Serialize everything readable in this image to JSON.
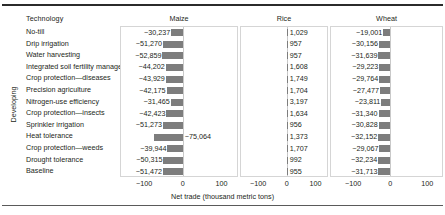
{
  "figure": {
    "group_label": "Developing",
    "technology_header": "Technology",
    "axis_title": "Net trade (thousand metric tons)",
    "tick_labels": [
      "−100",
      "0",
      "100"
    ],
    "tick_values": [
      -100,
      0,
      100
    ],
    "bar_color": "#7d7d7d",
    "panel_border_color": "#d5d5d5",
    "zero_line_color": "#c9c9c9"
  },
  "chart_data": {
    "type": "bar",
    "title": "",
    "subtitle": "",
    "xlabel": "Net trade (thousand metric tons)",
    "ylabel": "Technology",
    "orientation": "horizontal",
    "xlim": [
      -160,
      140
    ],
    "xticks": [
      -100,
      0,
      100
    ],
    "grid": false,
    "legend": "none",
    "units": "thousand metric tons",
    "group": "Developing",
    "panels": [
      "Maize",
      "Rice",
      "Wheat"
    ],
    "categories": [
      "No-till",
      "Drip irrigation",
      "Water harvesting",
      "Integrated soil fertility management",
      "Crop protection—diseases",
      "Precision agriculture",
      "Nitrogen-use efficiency",
      "Crop protection—insects",
      "Sprinkler irrigation",
      "Heat tolerance",
      "Crop protection—weeds",
      "Drought tolerance",
      "Baseline"
    ],
    "series": [
      {
        "name": "Maize",
        "values": [
          -30237,
          -51270,
          -52859,
          -44202,
          -43929,
          -42175,
          -31465,
          -42423,
          -51273,
          -75064,
          -39944,
          -50315,
          -51472
        ],
        "labels": [
          "−30,237",
          "−51,270",
          "−52,859",
          "−44,202",
          "−43,929",
          "−42,175",
          "−31,465",
          "−42,423",
          "−51,273",
          "−75,064",
          "−39,944",
          "−50,315",
          "−51,472"
        ]
      },
      {
        "name": "Rice",
        "values": [
          1029,
          957,
          957,
          1608,
          1749,
          1704,
          3197,
          1634,
          956,
          1373,
          1707,
          992,
          955
        ],
        "labels": [
          "1,029",
          "957",
          "957",
          "1,608",
          "1,749",
          "1,704",
          "3,197",
          "1,634",
          "956",
          "1,373",
          "1,707",
          "992",
          "955"
        ]
      },
      {
        "name": "Wheat",
        "values": [
          -19001,
          -30156,
          -31639,
          -29223,
          -29764,
          -27477,
          -23811,
          -31340,
          -30828,
          -32152,
          -29067,
          -32234,
          -31713
        ],
        "labels": [
          "−19,001",
          "−30,156",
          "−31,639",
          "−29,223",
          "−29,764",
          "−27,477",
          "−23,811",
          "−31,340",
          "−30,828",
          "−32,152",
          "−29,067",
          "−32,234",
          "−31,713"
        ]
      }
    ]
  }
}
